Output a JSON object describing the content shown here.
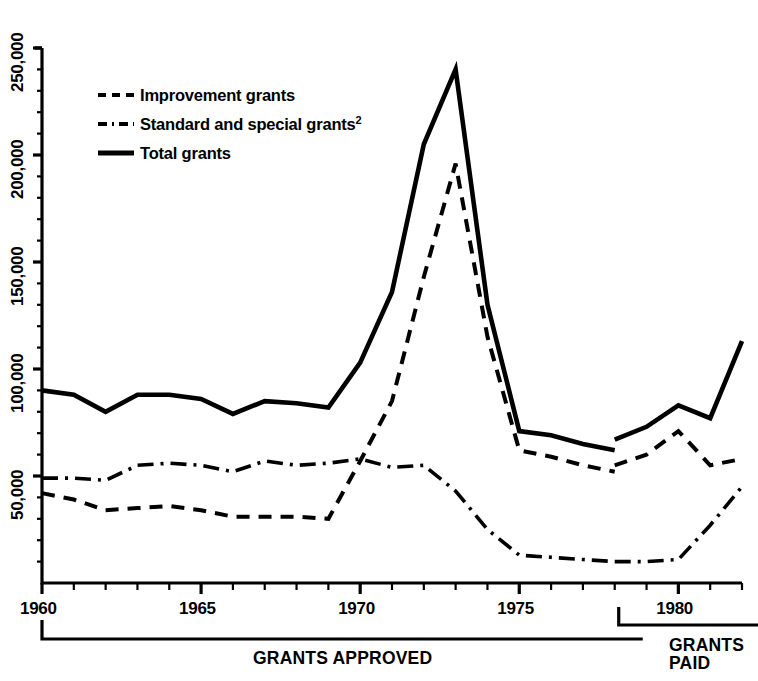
{
  "chart_data": {
    "type": "line",
    "title": "",
    "subtitle": "",
    "xlabel": "",
    "ylabel": "",
    "xlim": [
      1960,
      1982
    ],
    "ylim": [
      0,
      262000
    ],
    "grid": false,
    "legend_position": "upper-left",
    "x_ticks_major": [
      1960,
      1965,
      1970,
      1975,
      1980
    ],
    "x_tick_labels": [
      "1960",
      "1965",
      "1970",
      "1975",
      "1980"
    ],
    "x_minor_tick_interval": 1,
    "y_ticks_major": [
      50000,
      100000,
      150000,
      200000,
      250000
    ],
    "y_tick_labels": [
      "50,000",
      "100,000",
      "150,000",
      "200,000",
      "250,000"
    ],
    "y_minor_tick_interval": 10000,
    "legend": [
      {
        "label": "Improvement grants",
        "style": "dashed",
        "sup": ""
      },
      {
        "label": "Standard and special grants",
        "style": "dash-dot",
        "sup": "2"
      },
      {
        "label": "Total grants",
        "style": "solid",
        "sup": ""
      }
    ],
    "annotations": [
      {
        "text": "GRANTS APPROVED",
        "x_start": 1960,
        "x_end": 1978
      },
      {
        "text": "GRANTS PAID",
        "text_line1": "GRANTS",
        "text_line2": "PAID",
        "x_start": 1978,
        "x_end": 1982
      }
    ],
    "series": [
      {
        "name": "Total grants",
        "style": "solid",
        "segment": "approved",
        "x": [
          1960,
          1961,
          1962,
          1963,
          1964,
          1965,
          1966,
          1967,
          1968,
          1969,
          1970,
          1971,
          1972,
          1973,
          1974,
          1975,
          1976,
          1977,
          1978
        ],
        "values": [
          90000,
          88000,
          80000,
          88000,
          88000,
          86000,
          79000,
          85000,
          84000,
          82000,
          103000,
          136000,
          205000,
          240000,
          130000,
          71000,
          69000,
          65000,
          62000
        ]
      },
      {
        "name": "Improvement grants",
        "style": "dashed",
        "segment": "approved",
        "x": [
          1960,
          1961,
          1962,
          1963,
          1964,
          1965,
          1966,
          1967,
          1968,
          1969,
          1970,
          1971,
          1972,
          1973,
          1974,
          1975,
          1976,
          1977,
          1978
        ],
        "values": [
          42000,
          39000,
          34000,
          35000,
          36000,
          34000,
          31000,
          31000,
          31000,
          30000,
          57000,
          85000,
          143000,
          196000,
          115000,
          62000,
          59000,
          55000,
          52000
        ]
      },
      {
        "name": "Standard and special grants",
        "style": "dash-dot",
        "segment": "approved",
        "x": [
          1960,
          1961,
          1962,
          1963,
          1964,
          1965,
          1966,
          1967,
          1968,
          1969,
          1970,
          1971,
          1972,
          1973,
          1974,
          1975,
          1976,
          1977,
          1978
        ],
        "values": [
          49000,
          49000,
          48000,
          55000,
          56000,
          55000,
          52000,
          57000,
          55000,
          56000,
          58000,
          54000,
          55000,
          43000,
          25000,
          13000,
          12000,
          11000,
          10000
        ]
      },
      {
        "name": "Total grants",
        "style": "solid",
        "segment": "paid",
        "x": [
          1978,
          1979,
          1980,
          1981,
          1982
        ],
        "values": [
          67000,
          73000,
          83000,
          77000,
          113000
        ]
      },
      {
        "name": "Improvement grants",
        "style": "dashed",
        "segment": "paid",
        "x": [
          1978,
          1979,
          1980,
          1981,
          1982
        ],
        "values": [
          55000,
          60000,
          71000,
          55000,
          58000
        ]
      },
      {
        "name": "Standard and special grants",
        "style": "dash-dot",
        "segment": "paid",
        "x": [
          1978,
          1979,
          1980,
          1981,
          1982
        ],
        "values": [
          10000,
          10000,
          11000,
          27000,
          45000
        ]
      }
    ]
  },
  "axis": {
    "y_labels": [
      "250,000",
      "200,000",
      "150,000",
      "100,000",
      "50,000"
    ],
    "x_labels": [
      "1960",
      "1965",
      "1970",
      "1975",
      "1980"
    ]
  },
  "legend": {
    "improvement": "Improvement grants",
    "standard": "Standard and special grants",
    "standard_sup": "2",
    "total": "Total grants"
  },
  "brackets": {
    "approved": "GRANTS APPROVED",
    "paid_line1": "GRANTS",
    "paid_line2": "PAID"
  },
  "colors": {
    "ink": "#000000",
    "background": "#ffffff"
  }
}
